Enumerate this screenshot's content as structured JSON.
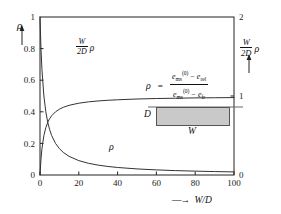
{
  "chart_data": {
    "type": "line",
    "title": "",
    "xlabel": "W/D",
    "xlabel_prefix_arrow": "→",
    "ylabel_left": "ρ",
    "ylabel_right": "W/2D ρ",
    "xlim": [
      0,
      100
    ],
    "ylim_left": [
      0,
      1
    ],
    "ylim_right": [
      0,
      2
    ],
    "xticks": [
      "0",
      "20",
      "40",
      "60",
      "80",
      "100"
    ],
    "xtick_values": [
      0,
      20,
      40,
      60,
      80,
      100
    ],
    "yticks_left": [
      "0",
      "0.2",
      "0.4",
      "0.6",
      "0.8",
      "1"
    ],
    "ytick_left_values": [
      0,
      0.2,
      0.4,
      0.6,
      0.8,
      1
    ],
    "yticks_right": [
      "0",
      "1",
      "2"
    ],
    "ytick_right_values": [
      0,
      1,
      2
    ],
    "grid": false,
    "legend_position": "inline-curve-labels",
    "series": [
      {
        "name": "rho",
        "label": "ρ",
        "axis": "left",
        "x": [
          0,
          0.5,
          1,
          2,
          3,
          4,
          5,
          6,
          8,
          10,
          12,
          15,
          20,
          25,
          30,
          35,
          40,
          50,
          60,
          70,
          80,
          90,
          100
        ],
        "y": [
          1.0,
          0.8,
          0.667,
          0.5,
          0.4,
          0.333,
          0.286,
          0.25,
          0.2,
          0.167,
          0.143,
          0.118,
          0.091,
          0.074,
          0.0625,
          0.054,
          0.0476,
          0.0385,
          0.0323,
          0.0278,
          0.0244,
          0.0217,
          0.0196
        ]
      },
      {
        "name": "w2d_rho",
        "label": "W/2D ρ",
        "axis": "right",
        "x": [
          0,
          0.5,
          1,
          2,
          3,
          4,
          5,
          6,
          8,
          10,
          12,
          15,
          20,
          25,
          30,
          35,
          40,
          50,
          60,
          70,
          80,
          90,
          100
        ],
        "y": [
          0,
          0.2,
          0.333,
          0.5,
          0.6,
          0.667,
          0.714,
          0.75,
          0.8,
          0.833,
          0.857,
          0.882,
          0.909,
          0.926,
          0.9375,
          0.946,
          0.952,
          0.962,
          0.968,
          0.972,
          0.976,
          0.978,
          0.98
        ]
      }
    ]
  },
  "axis_labels": {
    "left_rho": "ρ",
    "right_w": "W",
    "right_2d": "2D",
    "right_rho": "ρ",
    "x_arrow": "—→",
    "x_text": "W/D"
  },
  "curve_labels": {
    "upper_w": "W",
    "upper_2d": "2D",
    "upper_rho": "ρ",
    "lower_rho": "ρ"
  },
  "formula": {
    "lhs_rho": "ρ",
    "equals": "=",
    "numerator": {
      "e": "e",
      "sub": "ms",
      "sup": "(0)",
      "minus": "−",
      "e2": "e",
      "sub2": "rel"
    },
    "denominator": {
      "e": "e",
      "sub": "ms",
      "sup": "(0)",
      "minus": "−",
      "e2": "e",
      "sub2": "fr"
    }
  },
  "inset_diagram": {
    "height_label": "D",
    "width_label": "W",
    "fill_color": "#c9c9c9",
    "border_color": "#555555"
  },
  "colors": {
    "axis": "#222222",
    "curve": "#333333",
    "background": "#ffffff",
    "slab_fill": "#c9c9c9"
  }
}
